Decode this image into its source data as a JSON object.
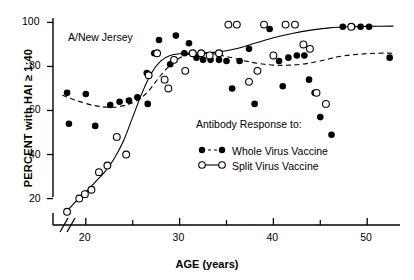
{
  "figure": {
    "panel_title": "A/New Jersey",
    "xlabel": "AGE (years)",
    "ylabel": "PERCENT with HAI ≥ 1:40",
    "axis_break": true
  },
  "legend": {
    "title": "Antibody Response to:",
    "entries": [
      {
        "label": "Whole Virus Vaccine",
        "marker": "filled-circle",
        "line": "dashed",
        "color": "#000000"
      },
      {
        "label": "Split Virus Vaccine",
        "marker": "open-circle",
        "line": "solid",
        "color": "#000000"
      }
    ]
  },
  "axes": {
    "y_ticks": [
      "20",
      "40",
      "60",
      "80",
      "100"
    ],
    "y_tick_values": [
      20,
      40,
      60,
      80,
      100
    ],
    "x_ticks": [
      "20",
      "30",
      "40",
      "50"
    ],
    "x_tick_values": [
      20,
      30,
      40,
      50
    ],
    "x_minor_values": [
      25,
      35,
      45
    ]
  },
  "chart_data": {
    "type": "scatter",
    "title": "A/New Jersey",
    "xlabel": "AGE (years)",
    "ylabel": "PERCENT with HAI ≥ 1:40",
    "xlim": [
      16.5,
      53.5
    ],
    "ylim": [
      8,
      102
    ],
    "grid": false,
    "legend_position": "center-right",
    "series": [
      {
        "name": "Whole Virus Vaccine",
        "marker": "filled-circle",
        "line": "dashed",
        "points": [
          [
            18.0,
            68.0
          ],
          [
            18.2,
            54.0
          ],
          [
            20.0,
            67.5
          ],
          [
            21.0,
            53.0
          ],
          [
            22.6,
            62.5
          ],
          [
            23.6,
            64.0
          ],
          [
            24.6,
            64.5
          ],
          [
            25.5,
            66.0
          ],
          [
            26.5,
            77.0
          ],
          [
            26.6,
            63.0
          ],
          [
            27.3,
            86.0
          ],
          [
            27.8,
            92.0
          ],
          [
            29.0,
            81.0
          ],
          [
            29.6,
            94.0
          ],
          [
            30.5,
            86.0
          ],
          [
            31.0,
            90.5
          ],
          [
            31.8,
            84.0
          ],
          [
            32.5,
            83.0
          ],
          [
            33.3,
            83.0
          ],
          [
            34.2,
            83.0
          ],
          [
            35.0,
            82.5
          ],
          [
            35.6,
            70.0
          ],
          [
            36.4,
            82.5
          ],
          [
            37.4,
            88.0
          ],
          [
            38.0,
            63.0
          ],
          [
            39.6,
            97.0
          ],
          [
            40.6,
            82.5
          ],
          [
            41.0,
            71.0
          ],
          [
            41.6,
            84.0
          ],
          [
            42.5,
            85.0
          ],
          [
            43.3,
            85.0
          ],
          [
            43.8,
            74.0
          ],
          [
            44.4,
            68.0
          ],
          [
            45.0,
            57.0
          ],
          [
            46.2,
            49.0
          ],
          [
            47.4,
            98.0
          ],
          [
            48.4,
            98.0
          ],
          [
            49.3,
            98.0
          ],
          [
            50.2,
            98.0
          ],
          [
            52.4,
            84.0
          ]
        ]
      },
      {
        "name": "Split Virus Vaccine",
        "marker": "open-circle",
        "line": "solid",
        "points": [
          [
            18.0,
            14.0
          ],
          [
            19.3,
            20.0
          ],
          [
            19.9,
            22.0
          ],
          [
            20.6,
            24.0
          ],
          [
            21.4,
            32.0
          ],
          [
            22.3,
            35.0
          ],
          [
            23.3,
            48.0
          ],
          [
            24.3,
            40.0
          ],
          [
            26.7,
            76.0
          ],
          [
            27.6,
            86.0
          ],
          [
            28.4,
            74.0
          ],
          [
            28.8,
            70.0
          ],
          [
            29.4,
            83.0
          ],
          [
            30.6,
            78.0
          ],
          [
            31.4,
            86.0
          ],
          [
            32.3,
            86.0
          ],
          [
            33.2,
            85.0
          ],
          [
            34.2,
            86.0
          ],
          [
            35.2,
            99.0
          ],
          [
            36.1,
            99.0
          ],
          [
            37.4,
            73.0
          ],
          [
            38.3,
            78.0
          ],
          [
            39.0,
            99.0
          ],
          [
            40.0,
            85.0
          ],
          [
            41.3,
            99.0
          ],
          [
            42.3,
            99.0
          ],
          [
            43.2,
            90.0
          ],
          [
            43.9,
            88.0
          ],
          [
            44.6,
            68.0
          ],
          [
            45.6,
            63.0
          ],
          [
            48.3,
            98.0
          ]
        ]
      }
    ],
    "fitted_curves": [
      {
        "name": "Whole Virus Vaccine",
        "style": "dashed",
        "points": [
          [
            17.5,
            67.0
          ],
          [
            19.0,
            64.5
          ],
          [
            21.0,
            62.2
          ],
          [
            23.0,
            61.5
          ],
          [
            25.0,
            63.5
          ],
          [
            26.5,
            68.0
          ],
          [
            28.0,
            76.0
          ],
          [
            29.5,
            82.5
          ],
          [
            31.0,
            85.5
          ],
          [
            33.0,
            86.0
          ],
          [
            35.0,
            84.5
          ],
          [
            37.0,
            82.5
          ],
          [
            39.0,
            81.0
          ],
          [
            41.0,
            80.5
          ],
          [
            43.0,
            81.0
          ],
          [
            45.0,
            82.5
          ],
          [
            47.0,
            84.5
          ],
          [
            49.0,
            85.5
          ],
          [
            51.0,
            86.0
          ],
          [
            52.8,
            86.0
          ]
        ]
      },
      {
        "name": "Split Virus Vaccine",
        "style": "solid",
        "points": [
          [
            17.8,
            13.5
          ],
          [
            19.0,
            19.0
          ],
          [
            20.0,
            23.0
          ],
          [
            21.0,
            27.5
          ],
          [
            22.0,
            32.0
          ],
          [
            23.0,
            38.0
          ],
          [
            24.0,
            46.0
          ],
          [
            25.0,
            57.0
          ],
          [
            26.0,
            68.0
          ],
          [
            27.0,
            77.0
          ],
          [
            28.0,
            82.5
          ],
          [
            29.0,
            85.0
          ],
          [
            30.5,
            86.0
          ],
          [
            32.0,
            86.0
          ],
          [
            34.0,
            86.5
          ],
          [
            36.0,
            88.0
          ],
          [
            38.0,
            90.5
          ],
          [
            40.0,
            93.0
          ],
          [
            42.0,
            95.0
          ],
          [
            44.0,
            96.5
          ],
          [
            46.0,
            97.5
          ],
          [
            48.0,
            98.0
          ],
          [
            50.0,
            98.2
          ],
          [
            52.8,
            98.3
          ]
        ]
      }
    ]
  }
}
